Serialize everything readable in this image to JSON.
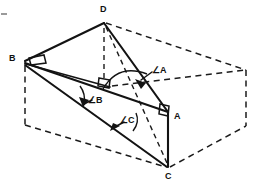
{
  "figure": {
    "canvas": {
      "width": 258,
      "height": 188,
      "background": "#ffffff"
    },
    "stroke_colors": {
      "solid": "#131313",
      "hidden": "#1b1b1b",
      "artifact": "#9a9a9a"
    },
    "vertices": [
      {
        "id": "D",
        "label": "D",
        "x": 104,
        "y": 22,
        "label_x": 100,
        "label_y": 7,
        "kind": "solid-vertex"
      },
      {
        "id": "B",
        "label": "B",
        "x": 24,
        "y": 61,
        "label_x": 10,
        "label_y": 55,
        "kind": "solid-vertex"
      },
      {
        "id": "A",
        "label": "A",
        "x": 168,
        "y": 112,
        "label_x": 174,
        "label_y": 113,
        "kind": "solid-vertex"
      },
      {
        "id": "C",
        "label": "C",
        "x": 168,
        "y": 168,
        "label_x": 165,
        "label_y": 173,
        "kind": "solid-vertex"
      }
    ],
    "angle_markers": [
      {
        "id": "angle-a",
        "label": "∠A",
        "at_vertex": "A",
        "label_x": 152,
        "label_y": 68
      },
      {
        "id": "angle-b",
        "label": "∠B",
        "at_vertex": "B",
        "label_x": 88,
        "label_y": 98
      },
      {
        "id": "angle-c",
        "label": "∠C",
        "at_vertex": "C",
        "label_x": 118,
        "label_y": 118
      }
    ],
    "right_angle_markers": [
      {
        "id": "right-angle-at-b",
        "near_vertex": "B"
      },
      {
        "id": "right-angle-at-a",
        "near_vertex": "A"
      },
      {
        "id": "right-angle-box-back-corner",
        "near_vertex": "back-top-interior"
      }
    ],
    "box_corners": {
      "top_back_left": {
        "x": 24,
        "y": 61
      },
      "top_back_right": {
        "x": 104,
        "y": 22
      },
      "top_front_right": {
        "x": 246,
        "y": 70
      },
      "top_front_left": {
        "x": 104,
        "y": 85
      },
      "bottom_back_left": {
        "x": 24,
        "y": 125
      },
      "bottom_front_right": {
        "x": 246,
        "y": 126
      },
      "bottom_front_mid": {
        "x": 168,
        "y": 168
      }
    },
    "solid_segments": [
      {
        "id": "edge-BD",
        "from": "B",
        "to": "D"
      },
      {
        "id": "edge-BA",
        "from": "B",
        "to": "A"
      },
      {
        "id": "edge-BC",
        "from": "B",
        "to": "C"
      },
      {
        "id": "edge-DA",
        "from": "D",
        "to": "A"
      },
      {
        "id": "edge-AC",
        "from": "A",
        "to": "C"
      },
      {
        "id": "edge-box-top-left-to-front",
        "from": "top_back_left",
        "to": "top_front_left"
      }
    ],
    "hidden_segments": [
      {
        "id": "edge-DC-hidden",
        "from": "D",
        "to": "C"
      },
      {
        "id": "edge-D-vertical-hidden",
        "from": "D",
        "to": "top_front_left"
      },
      {
        "id": "edge-box-top-right",
        "from": "D",
        "to": "top_front_right"
      },
      {
        "id": "edge-box-right-vertical",
        "from": "top_front_right",
        "to": "bottom_front_right"
      },
      {
        "id": "edge-box-left-vertical",
        "from": "B",
        "to": "bottom_back_left"
      },
      {
        "id": "edge-box-bottom-left-diag",
        "from": "bottom_back_left",
        "to": "bottom_front_mid"
      },
      {
        "id": "edge-box-bottom-right-diag",
        "from": "bottom_front_mid",
        "to": "bottom_front_right"
      },
      {
        "id": "edge-box-front-right-upper",
        "from": "top_front_left",
        "to": "top_front_right"
      }
    ],
    "notes": {
      "description": "Line drawing: a tetrahedron ABCD drawn with solid lines inside a rectangular prism whose concealed edges are dashed. Right-angle squares appear at vertex B, at vertex A, and at the interior back corner of the box. Angles A, B and C are each marked with a curved arc and a leader line to its label."
    }
  }
}
